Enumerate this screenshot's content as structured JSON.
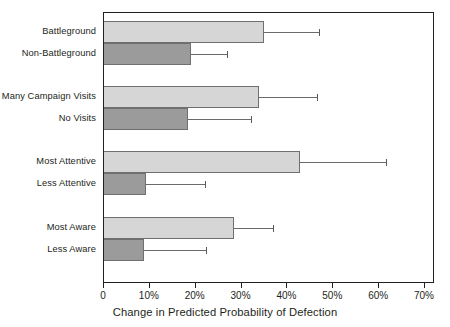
{
  "chart_data": {
    "type": "bar",
    "orientation": "horizontal",
    "title": "",
    "xlabel": "Change in Predicted Probability of Defection",
    "ylabel": "",
    "xlim": [
      0,
      70
    ],
    "xtick_values": [
      0,
      10,
      20,
      30,
      40,
      50,
      60,
      70
    ],
    "xtick_labels": [
      "0",
      "10%",
      "20%",
      "30%",
      "40%",
      "50%",
      "60%",
      "70%"
    ],
    "grid": false,
    "legend": "none",
    "error_bars": "upper only (95% confidence interval upper bound)",
    "colors": {
      "light_bar": "#d6d6d6",
      "dark_bar": "#9b9b9b",
      "bar_outline": "#6f6f6f",
      "error_bar": "#5a5a5a",
      "axis": "#231f20",
      "background": "#ffffff"
    },
    "groups": [
      {
        "name": "Battleground status",
        "bars": [
          {
            "label": "Battleground",
            "value": 34.9,
            "error_upper": 46.9,
            "shade": "light"
          },
          {
            "label": "Non-Battleground",
            "value": 19.0,
            "error_upper": 26.8,
            "shade": "dark"
          }
        ]
      },
      {
        "name": "Campaign visits",
        "bars": [
          {
            "label": "Many Campaign Visits",
            "value": 33.8,
            "error_upper": 46.4,
            "shade": "light"
          },
          {
            "label": "No Visits",
            "value": 18.3,
            "error_upper": 32.1,
            "shade": "dark"
          }
        ]
      },
      {
        "name": "Attentiveness",
        "bars": [
          {
            "label": "Most Attentive",
            "value": 42.7,
            "error_upper": 61.5,
            "shade": "light"
          },
          {
            "label": "Less Attentive",
            "value": 9.2,
            "error_upper": 22.0,
            "shade": "dark"
          }
        ]
      },
      {
        "name": "Awareness",
        "bars": [
          {
            "label": "Most Aware",
            "value": 28.3,
            "error_upper": 36.9,
            "shade": "light"
          },
          {
            "label": "Less Aware",
            "value": 8.7,
            "error_upper": 22.2,
            "shade": "dark"
          }
        ]
      }
    ]
  }
}
